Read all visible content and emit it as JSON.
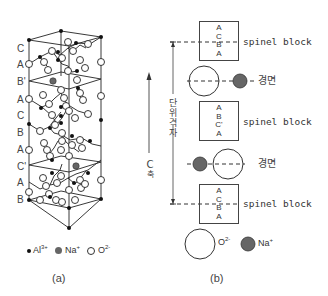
{
  "panel_a": {
    "caption": "(a)",
    "layer_labels": [
      "C",
      "A",
      "B'",
      "A",
      "C",
      "B",
      "A",
      "C'",
      "A",
      "B"
    ],
    "legend": [
      {
        "symbol": "small-black-dot",
        "label": "Al",
        "charge": "3+"
      },
      {
        "symbol": "gray-filled-circle",
        "label": "Na",
        "charge": "+"
      },
      {
        "symbol": "open-circle",
        "label": "O",
        "charge": "2-"
      }
    ]
  },
  "panel_b": {
    "caption": "(b)",
    "axis_label_c": "C",
    "axis_label_suffix": "축",
    "unit_cell_label": [
      "단",
      "위",
      "격",
      "자"
    ],
    "blocks": [
      {
        "layers": [
          "A",
          "C",
          "B",
          "A"
        ],
        "label": "spinel block"
      },
      {
        "layers": [
          "A",
          "B",
          "C'",
          "A"
        ],
        "label": "spinel block"
      },
      {
        "layers": [
          "A",
          "C",
          "B",
          "A"
        ],
        "label": "spinel block"
      }
    ],
    "mirror_planes": [
      {
        "label": "경면"
      },
      {
        "label": "경면"
      }
    ],
    "legend": [
      {
        "symbol": "large-open-circle",
        "label": "O",
        "charge": "2-"
      },
      {
        "symbol": "gray-filled-circle",
        "label": "Na",
        "charge": "+"
      }
    ]
  }
}
